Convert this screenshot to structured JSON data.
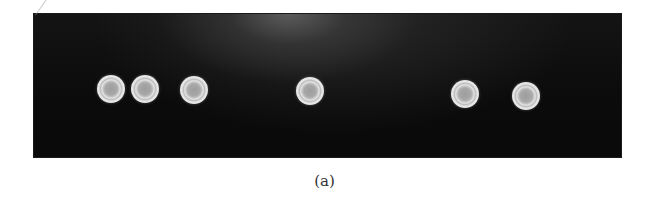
{
  "figure": {
    "caption": "(a)",
    "panel_color": "#0b0b0b",
    "disc_color": "#d8d8d8",
    "disc_center_color": "#a0a0a0",
    "discs": [
      {
        "id": 1,
        "x": 111,
        "y": 89
      },
      {
        "id": 2,
        "x": 145,
        "y": 89
      },
      {
        "id": 3,
        "x": 194,
        "y": 90
      },
      {
        "id": 4,
        "x": 310,
        "y": 91
      },
      {
        "id": 5,
        "x": 465,
        "y": 94
      },
      {
        "id": 6,
        "x": 526,
        "y": 96
      }
    ]
  }
}
